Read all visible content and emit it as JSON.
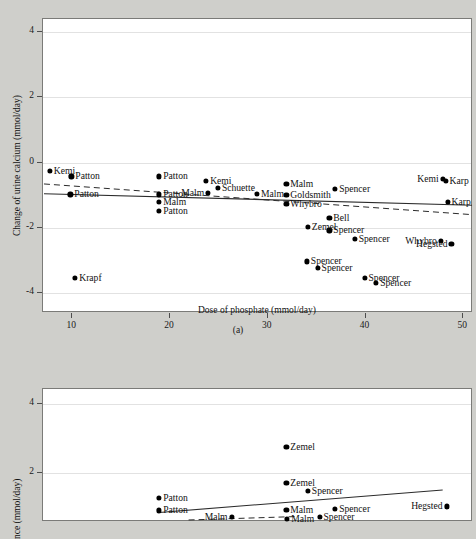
{
  "page": {
    "background_color": "#cfcfcb"
  },
  "figures": [
    {
      "id": "a",
      "caption": "(a)",
      "chart_data": {
        "type": "scatter",
        "title": "",
        "xlabel": "Dose of phosphate (mmol/day)",
        "ylabel": "Change of urine calcium (mmol/day)",
        "xlim": [
          7,
          51
        ],
        "ylim": [
          -4.6,
          4.4
        ],
        "xticks": [
          10,
          20,
          30,
          40,
          50
        ],
        "yticks": [
          4,
          2,
          0,
          -2,
          -4
        ],
        "grid": true,
        "legend": "none",
        "points": [
          {
            "label": "Kemi",
            "x": 7.8,
            "y": -0.28,
            "label_side": "right"
          },
          {
            "label": "Patton",
            "x": 10.0,
            "y": -0.45,
            "label_side": "right"
          },
          {
            "label": "Patton",
            "x": 9.9,
            "y": -1.0,
            "label_side": "right"
          },
          {
            "label": "Krapf",
            "x": 10.4,
            "y": -3.55,
            "label_side": "right"
          },
          {
            "label": "Patton",
            "x": 19.0,
            "y": -0.45,
            "label_side": "right"
          },
          {
            "label": "Patton",
            "x": 19.0,
            "y": -1.0,
            "label_side": "right"
          },
          {
            "label": "Malm",
            "x": 19.0,
            "y": -1.22,
            "label_side": "right"
          },
          {
            "label": "Patton",
            "x": 19.0,
            "y": -1.5,
            "label_side": "right"
          },
          {
            "label": "Kemi",
            "x": 23.8,
            "y": -0.58,
            "label_side": "right"
          },
          {
            "label": "Schuette",
            "x": 25.0,
            "y": -0.8,
            "label_side": "right"
          },
          {
            "label": "Malm",
            "x": 24.0,
            "y": -0.95,
            "label_side": "left"
          },
          {
            "label": "Malm",
            "x": 29.0,
            "y": -0.98,
            "label_side": "right"
          },
          {
            "label": "Malm",
            "x": 32.0,
            "y": -0.68,
            "label_side": "right"
          },
          {
            "label": "Goldsmith",
            "x": 32.0,
            "y": -1.02,
            "label_side": "right"
          },
          {
            "label": "Whybro",
            "x": 32.0,
            "y": -1.3,
            "label_side": "right"
          },
          {
            "label": "Spencer",
            "x": 37.0,
            "y": -0.82,
            "label_side": "right"
          },
          {
            "label": "Bell",
            "x": 36.4,
            "y": -1.72,
            "label_side": "right"
          },
          {
            "label": "Spencer",
            "x": 36.4,
            "y": -2.1,
            "label_side": "right"
          },
          {
            "label": "Zemel",
            "x": 34.2,
            "y": -2.0,
            "label_side": "right"
          },
          {
            "label": "Spencer",
            "x": 39.0,
            "y": -2.35,
            "label_side": "right"
          },
          {
            "label": "Spencer",
            "x": 34.1,
            "y": -3.05,
            "label_side": "right"
          },
          {
            "label": "Spencer",
            "x": 35.2,
            "y": -3.25,
            "label_side": "right"
          },
          {
            "label": "Spencer",
            "x": 40.0,
            "y": -3.55,
            "label_side": "right"
          },
          {
            "label": "Spencer",
            "x": 41.2,
            "y": -3.7,
            "label_side": "right"
          },
          {
            "label": "Kemi",
            "x": 48.0,
            "y": -0.52,
            "label_side": "left"
          },
          {
            "label": "Karp",
            "x": 48.3,
            "y": -0.58,
            "label_side": "right"
          },
          {
            "label": "Karp",
            "x": 48.5,
            "y": -1.22,
            "label_side": "right"
          },
          {
            "label": "Whybro",
            "x": 47.8,
            "y": -2.42,
            "label_side": "left"
          },
          {
            "label": "Hegsted",
            "x": 48.9,
            "y": -2.52,
            "label_side": "left"
          }
        ],
        "lines": [
          {
            "name": "solid-fit",
            "style": "solid",
            "x0": 7.2,
            "y0": -0.98,
            "x1": 51.0,
            "y1": -1.33
          },
          {
            "name": "dashed-fit",
            "style": "dashed",
            "x0": 7.2,
            "y0": -0.68,
            "x1": 51.0,
            "y1": -1.62
          }
        ]
      }
    },
    {
      "id": "b",
      "caption": "",
      "chart_data": {
        "type": "scatter",
        "title": "",
        "xlabel": "",
        "ylabel": "nce (mmol/day)",
        "xlim": [
          7,
          51
        ],
        "ylim": [
          0.55,
          4.45
        ],
        "xticks": [],
        "yticks": [
          4,
          2
        ],
        "grid": true,
        "legend": "none",
        "points": [
          {
            "label": "Zemel",
            "x": 32.0,
            "y": 2.72,
            "label_side": "right"
          },
          {
            "label": "Zemel",
            "x": 32.0,
            "y": 1.66,
            "label_side": "right"
          },
          {
            "label": "Spencer",
            "x": 34.2,
            "y": 1.44,
            "label_side": "right"
          },
          {
            "label": "Patton",
            "x": 19.0,
            "y": 1.22,
            "label_side": "right"
          },
          {
            "label": "Patton",
            "x": 19.0,
            "y": 0.86,
            "label_side": "right"
          },
          {
            "label": "Malm",
            "x": 32.0,
            "y": 0.88,
            "label_side": "right"
          },
          {
            "label": "Spencer",
            "x": 37.0,
            "y": 0.9,
            "label_side": "right"
          },
          {
            "label": "Hegsted",
            "x": 48.4,
            "y": 0.98,
            "label_side": "left"
          },
          {
            "label": "Malm",
            "x": 26.4,
            "y": 0.66,
            "label_side": "left"
          },
          {
            "label": "Spencer",
            "x": 35.4,
            "y": 0.66,
            "label_side": "right"
          },
          {
            "label": "Malm",
            "x": 32.1,
            "y": 0.62,
            "label_side": "right"
          }
        ],
        "lines": [
          {
            "name": "solid-fit",
            "style": "solid",
            "x0": 19.0,
            "y0": 0.8,
            "x1": 48.0,
            "y1": 1.46
          },
          {
            "name": "dashed-fit",
            "style": "dashed",
            "x0": 22.0,
            "y0": 0.58,
            "x1": 33.0,
            "y1": 0.68
          }
        ]
      }
    }
  ]
}
